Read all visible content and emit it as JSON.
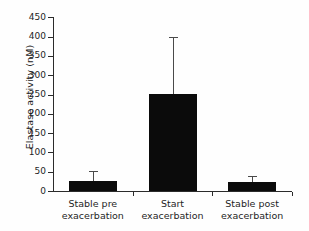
{
  "chart_data": {
    "type": "bar",
    "title": "",
    "xlabel": "",
    "ylabel": "Elastase activity (nM)",
    "categories": [
      "Stable pre exacerbation",
      "Start exacerbation",
      "Stable post exacerbation"
    ],
    "category_lines": [
      {
        "line1": "Stable pre",
        "line2": "exacerbation"
      },
      {
        "line1": "Start",
        "line2": "exacerbation"
      },
      {
        "line1": "Stable post",
        "line2": "exacerbation"
      }
    ],
    "values": [
      27,
      252,
      23
    ],
    "errors_upper": [
      25,
      148,
      17
    ],
    "error_tops": [
      52,
      400,
      40
    ],
    "ylim": [
      0,
      450
    ],
    "yticks": [
      0,
      50,
      100,
      150,
      200,
      250,
      300,
      350,
      400,
      450
    ],
    "ytick_labels": [
      "0",
      "50",
      "100",
      "150",
      "200",
      "250",
      "300",
      "350",
      "400",
      "450"
    ],
    "grid": false,
    "legend": false,
    "bar_color": "#0b0b0b",
    "error_color": "#4a4a4a",
    "axis_color": "#2b2b2b",
    "background": "#fefefe"
  }
}
